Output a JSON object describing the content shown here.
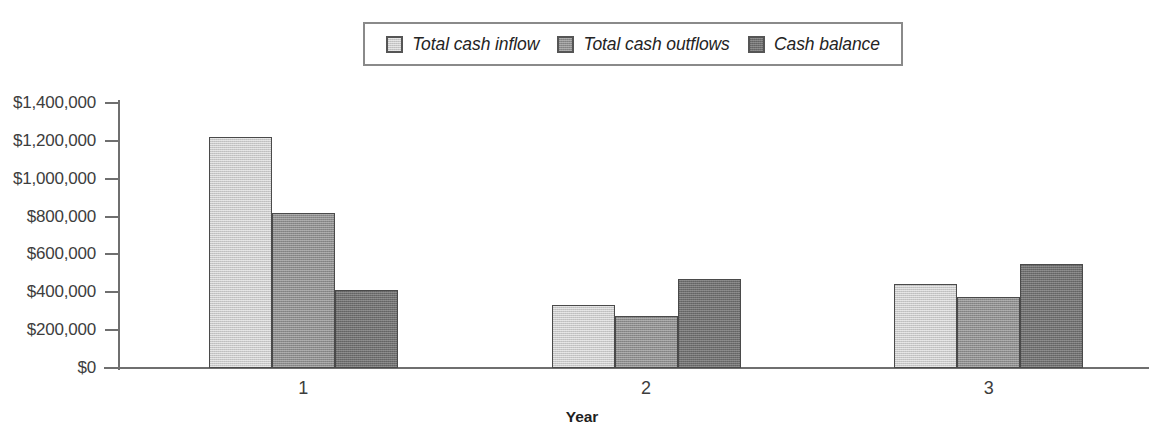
{
  "chart_data": {
    "type": "bar",
    "title": "",
    "subtitle": "",
    "xlabel": "Year",
    "ylabel": "",
    "categories": [
      "1",
      "2",
      "3"
    ],
    "series": [
      {
        "name": "Total cash inflow",
        "values": [
          1220000,
          335000,
          445000
        ],
        "color": "#c9c9c9"
      },
      {
        "name": "Total cash outflows",
        "values": [
          820000,
          275000,
          375000
        ],
        "color": "#8d8d8d"
      },
      {
        "name": "Cash balance",
        "values": [
          410000,
          470000,
          550000
        ],
        "color": "#6f6f6f"
      }
    ],
    "ylim": [
      0,
      1400000
    ],
    "ytick_values": [
      0,
      200000,
      400000,
      600000,
      800000,
      1000000,
      1200000,
      1400000
    ],
    "ytick_labels": [
      "$0",
      "$200,000",
      "$400,000",
      "$600,000",
      "$800,000",
      "$1,000,000",
      "$1,200,000",
      "$1,400,000"
    ],
    "grid": false,
    "legend_position": "top-center",
    "legend_entries": [
      "Total cash inflow",
      "Total cash outflows",
      "Cash balance"
    ]
  }
}
